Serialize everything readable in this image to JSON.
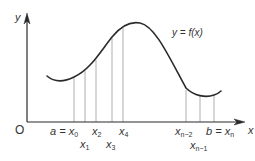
{
  "diagram": {
    "colors": {
      "curve": "#2a2a2a",
      "axis": "#2a2a2a",
      "partition": "#9a9a9a",
      "text": "#333333"
    },
    "axes": {
      "x_label": "x",
      "y_label": "y",
      "origin_label": "O"
    },
    "curve_label": "y = f(x)",
    "partition_labels": {
      "x0": {
        "prefix": "a = x",
        "sub": "0"
      },
      "x1": {
        "base": "x",
        "sub": "1"
      },
      "x2": {
        "base": "x",
        "sub": "2"
      },
      "x3": {
        "base": "x",
        "sub": "3"
      },
      "x4": {
        "base": "x",
        "sub": "4"
      },
      "xn2": {
        "base": "x",
        "sub": "n−2"
      },
      "xn1": {
        "base": "x",
        "sub": "n−1"
      },
      "xn": {
        "prefix": "b = x",
        "sub": "n"
      }
    }
  }
}
